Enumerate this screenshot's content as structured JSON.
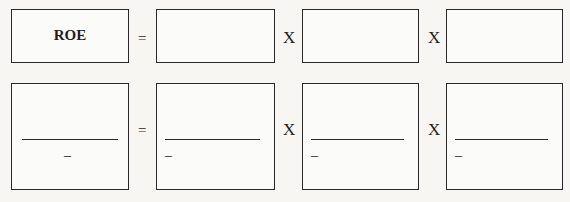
{
  "equation_row_1": {
    "lhs_label": "ROE",
    "operators": [
      "=",
      "X",
      "X"
    ],
    "factor_boxes": [
      "",
      "",
      ""
    ]
  },
  "equation_row_2": {
    "operators": [
      "=",
      "X",
      "X"
    ],
    "fractions": [
      {
        "numerator": "",
        "denominator_marker": "–"
      },
      {
        "numerator": "",
        "denominator_marker": "–"
      },
      {
        "numerator": "",
        "denominator_marker": "–"
      },
      {
        "numerator": "",
        "denominator_marker": "–"
      }
    ]
  }
}
